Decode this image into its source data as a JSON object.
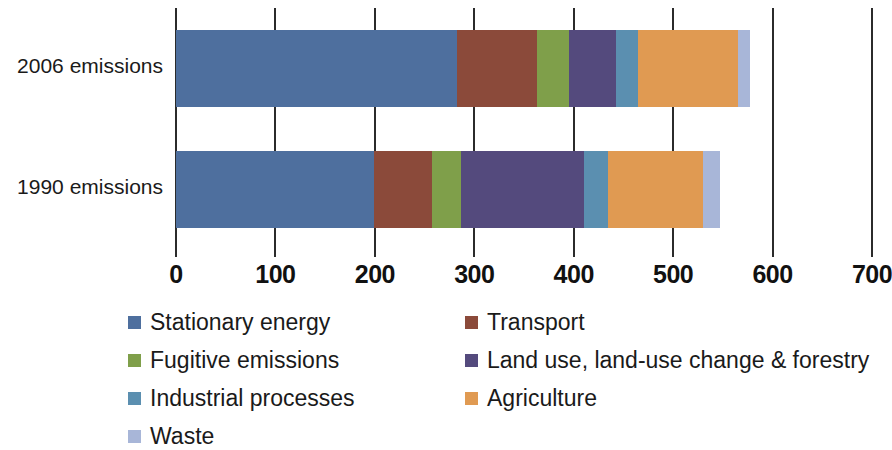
{
  "chart_data": {
    "type": "bar",
    "orientation": "horizontal",
    "stacked": true,
    "title": "",
    "xlabel": "",
    "ylabel": "",
    "xlim": [
      0,
      700
    ],
    "xticks": [
      0,
      100,
      200,
      300,
      400,
      500,
      600,
      700
    ],
    "xtick_labels": [
      "0",
      "100",
      "200",
      "300",
      "400",
      "500",
      "600",
      "700"
    ],
    "grid": true,
    "grid_axis": "x",
    "legend_position": "bottom",
    "categories": [
      "2006 emissions",
      "1990 emissions"
    ],
    "series": [
      {
        "name": "Stationary energy",
        "color": "#4e6f9e",
        "values": [
          283,
          199
        ]
      },
      {
        "name": "Transport",
        "color": "#8b4a3a",
        "values": [
          80,
          58
        ]
      },
      {
        "name": "Fugitive emissions",
        "color": "#7f9f4a",
        "values": [
          32,
          30
        ]
      },
      {
        "name": "Land use, land-use change & forestry",
        "color": "#544a7d",
        "values": [
          48,
          123
        ]
      },
      {
        "name": "Industrial processes",
        "color": "#5b8fb0",
        "values": [
          22,
          25
        ]
      },
      {
        "name": "Agriculture",
        "color": "#e09a52",
        "values": [
          100,
          95
        ]
      },
      {
        "name": "Waste",
        "color": "#a8b6d8",
        "values": [
          12,
          17
        ]
      }
    ],
    "totals": [
      577,
      547
    ]
  },
  "legend": {
    "columns": [
      [
        {
          "label": "Stationary energy",
          "color": "#4e6f9e"
        },
        {
          "label": "Fugitive emissions",
          "color": "#7f9f4a"
        },
        {
          "label": "Industrial processes",
          "color": "#5b8fb0"
        },
        {
          "label": "Waste",
          "color": "#a8b6d8"
        }
      ],
      [
        {
          "label": "Transport",
          "color": "#8b4a3a"
        },
        {
          "label": "Land use, land-use change & forestry",
          "color": "#544a7d"
        },
        {
          "label": "Agriculture",
          "color": "#e09a52"
        }
      ]
    ]
  },
  "axis": {
    "line_color": "#2b2b2b"
  }
}
